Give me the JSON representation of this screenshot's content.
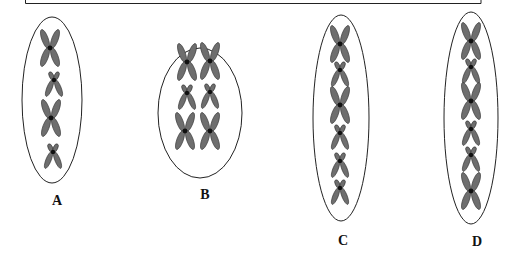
{
  "diagram": {
    "title_box": {
      "visible_part": "bottom edge of a bordered box"
    },
    "cells": [
      {
        "label": "A",
        "chromosomes": [
          {
            "size": "large"
          },
          {
            "size": "small"
          },
          {
            "size": "large"
          },
          {
            "size": "small"
          }
        ],
        "arrangement": "single column"
      },
      {
        "label": "B",
        "chromosomes": [
          {
            "size": "large"
          },
          {
            "size": "large"
          },
          {
            "size": "small"
          },
          {
            "size": "small"
          },
          {
            "size": "large"
          },
          {
            "size": "large"
          }
        ],
        "arrangement": "two columns, paired"
      },
      {
        "label": "C",
        "chromosomes": [
          {
            "size": "large"
          },
          {
            "size": "small"
          },
          {
            "size": "large"
          },
          {
            "size": "small"
          },
          {
            "size": "small"
          },
          {
            "size": "small"
          }
        ],
        "arrangement": "single column"
      },
      {
        "label": "D",
        "chromosomes": [
          {
            "size": "large"
          },
          {
            "size": "small"
          },
          {
            "size": "large"
          },
          {
            "size": "small"
          },
          {
            "size": "small"
          },
          {
            "size": "large"
          }
        ],
        "arrangement": "single column"
      }
    ],
    "colors": {
      "chromatid": "#6e6e6e",
      "centromere": "#111111",
      "outline": "#222222"
    }
  }
}
